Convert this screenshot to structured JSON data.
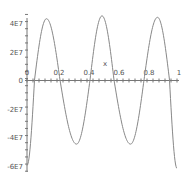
{
  "chart_data": {
    "type": "line",
    "title": "",
    "xlabel": "x",
    "ylabel": "",
    "xlim": [
      0,
      1
    ],
    "ylim": [
      -62000000.0,
      50000000.0
    ],
    "grid": false,
    "legend": null,
    "x_ticks": [
      "0",
      "0.2",
      "0.4",
      "0.6",
      "0.8",
      "1"
    ],
    "y_ticks": [
      "4E7",
      "2E7",
      "0",
      "-2E7",
      "-4E7",
      "-6E7"
    ],
    "series": [
      {
        "name": "f(x)",
        "color": "#888888",
        "x": [
          0.0,
          0.05,
          0.13,
          0.22,
          0.33,
          0.42,
          0.5,
          0.58,
          0.69,
          0.78,
          0.87,
          0.95,
          1.0
        ],
        "y": [
          -60000000.0,
          0,
          43000000.0,
          0,
          -45000000.0,
          0,
          45000000.0,
          0,
          -45000000.0,
          0,
          44000000.0,
          0,
          -62000000.0
        ]
      }
    ]
  }
}
